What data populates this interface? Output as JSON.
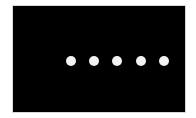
{
  "screen": {
    "background": "#000000",
    "indicator": {
      "type": "loading-dots",
      "count": 5,
      "color": "#f2f2f2"
    }
  }
}
